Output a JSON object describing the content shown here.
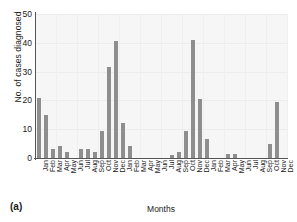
{
  "panel": {
    "label": "(a)"
  },
  "chart_data": {
    "type": "bar",
    "title": "",
    "xlabel": "Months",
    "ylabel": "No. of cases diagnosed",
    "ylim": [
      0,
      50
    ],
    "yticks": [
      0,
      10,
      20,
      30,
      40,
      50
    ],
    "grid": true,
    "legend": false,
    "bar_color": "#8e8e8e",
    "plot_background": "#f6f6f6",
    "categories": [
      "Jan",
      "Feb",
      "Mar",
      "Apr",
      "May",
      "Jun",
      "Jul",
      "Aug",
      "Sep",
      "Oct",
      "Nov",
      "Dec",
      "Jan",
      "Feb",
      "Mar",
      "Apr",
      "May",
      "Jun",
      "Jul",
      "Aug",
      "Sep",
      "Oct",
      "Nov",
      "Dec",
      "Jan",
      "Feb",
      "Mar",
      "Apr",
      "May",
      "Jun",
      "Jul",
      "Aug",
      "Sep",
      "Oct",
      "Nov",
      "Dec"
    ],
    "values": [
      21,
      15,
      3,
      4,
      2,
      0,
      3,
      3,
      2,
      9.5,
      31.5,
      40.5,
      12,
      4,
      0,
      0,
      0,
      0,
      0,
      1,
      2,
      9.5,
      41,
      20.5,
      6.5,
      0,
      0,
      1.5,
      1.5,
      0,
      0,
      0,
      0,
      5,
      19.5,
      0
    ]
  }
}
